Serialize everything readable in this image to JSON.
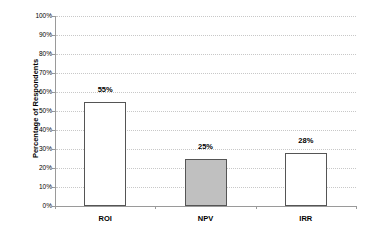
{
  "chart_data": {
    "type": "bar",
    "title": "",
    "xlabel": "",
    "ylabel": "Percentage of Respondents",
    "categories": [
      "ROI",
      "NPV",
      "IRR"
    ],
    "values": [
      55,
      25,
      28
    ],
    "value_labels": [
      "55%",
      "25%",
      "28%"
    ],
    "bar_colors": [
      "#ffffff",
      "#c0c0c0",
      "#ffffff"
    ],
    "ylim": [
      0,
      100
    ],
    "yticks": [
      "0%",
      "10%",
      "20%",
      "30%",
      "40%",
      "50%",
      "60%",
      "70%",
      "80%",
      "90%",
      "100%"
    ],
    "grid": true,
    "legend": null
  }
}
